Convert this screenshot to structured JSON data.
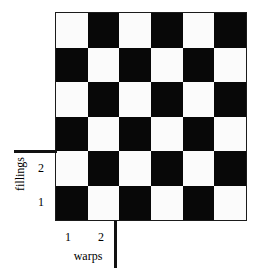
{
  "figure": {
    "name": "plain-weave-draft-diagram",
    "background_color": "#ffffff",
    "dark_color": "#080808",
    "light_color": "#fbfbfb",
    "border_color": "#1b1b1b"
  },
  "axes": {
    "vertical": {
      "title": "fillings",
      "ticks": [
        {
          "label": "2"
        },
        {
          "label": "1"
        }
      ]
    },
    "horizontal": {
      "title": "warps",
      "ticks": [
        {
          "label": "1"
        },
        {
          "label": "2"
        }
      ]
    }
  },
  "chart_data": {
    "type": "heatmap",
    "title": "",
    "xlabel": "warps",
    "ylabel": "fillings",
    "columns": 6,
    "rows": 6,
    "xticklabels": [
      "1",
      "2"
    ],
    "yticklabels": [
      "1",
      "2"
    ],
    "legend": "none",
    "grid": true,
    "colormap": {
      "0": "#fbfbfb",
      "1": "#080808"
    },
    "note": "Plain weave (1/1) interlacing draft: value 1 = warp over filling (dark), value 0 = filling over warp (light). Rows listed top to bottom, columns left to right.",
    "values": [
      [
        0,
        1,
        0,
        1,
        0,
        1
      ],
      [
        1,
        0,
        1,
        0,
        1,
        0
      ],
      [
        0,
        1,
        0,
        1,
        0,
        1
      ],
      [
        1,
        0,
        1,
        0,
        1,
        0
      ],
      [
        0,
        1,
        0,
        1,
        0,
        1
      ],
      [
        1,
        0,
        1,
        0,
        1,
        0
      ]
    ]
  }
}
